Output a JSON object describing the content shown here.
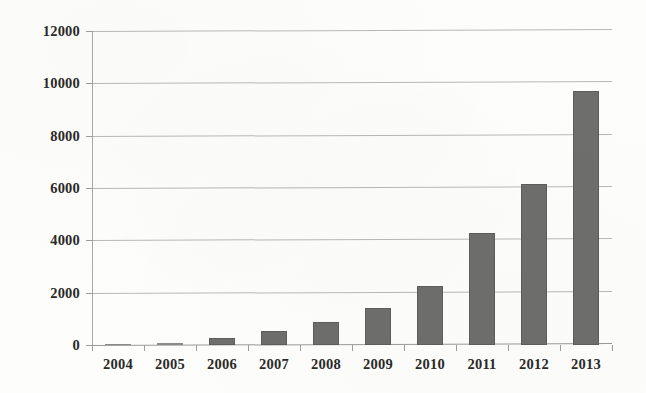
{
  "chart_data": {
    "type": "bar",
    "title": "",
    "subtitle": "",
    "xlabel": "",
    "ylabel": "",
    "categories": [
      "2004",
      "2005",
      "2006",
      "2007",
      "2008",
      "2009",
      "2010",
      "2011",
      "2012",
      "2013"
    ],
    "values": [
      10,
      60,
      250,
      530,
      880,
      1400,
      2250,
      4280,
      6150,
      9700
    ],
    "ylim": [
      0,
      12000
    ],
    "ytick_labels": [
      "0",
      "2000",
      "4000",
      "6000",
      "8000",
      "10000",
      "12000"
    ],
    "ytick_values": [
      0,
      2000,
      4000,
      6000,
      8000,
      10000,
      12000
    ],
    "grid": true,
    "grid_axis": "y",
    "legend": null,
    "legend_position": "none",
    "series": [
      {
        "name": "",
        "values": [
          10,
          60,
          250,
          530,
          880,
          1400,
          2250,
          4280,
          6150,
          9700
        ]
      }
    ],
    "colors": {
      "bar_fill": "#6e6e6c",
      "bar_edge": "#5d5d5b",
      "gridline": "#b9b9b5",
      "axis": "#a9a9a5",
      "text": "#2a2a28",
      "background": "#fdfdfb"
    }
  }
}
